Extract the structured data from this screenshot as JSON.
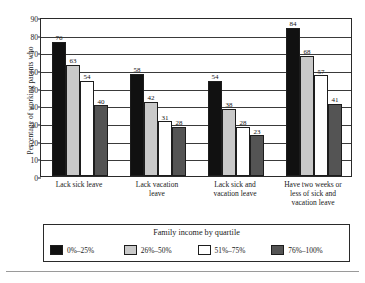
{
  "chart_data": {
    "type": "bar",
    "title": "",
    "xlabel": "",
    "ylabel": "Percentage of working parents who",
    "ylim": [
      0,
      90
    ],
    "ytick_step": 10,
    "yticks": [
      0,
      10,
      20,
      30,
      40,
      50,
      60,
      70,
      80,
      90
    ],
    "grid": true,
    "legend_position": "bottom",
    "legend_title": "Family income by quartile",
    "categories": [
      "Lack sick leave",
      "Lack vacation leave",
      "Lack sick and vacation leave",
      "Have two weeks or less of sick and vacation leave"
    ],
    "category_lines": [
      [
        "Lack sick leave"
      ],
      [
        "Lack vacation",
        "leave"
      ],
      [
        "Lack sick and",
        "vacation leave"
      ],
      [
        "Have two weeks or",
        "less of sick and",
        "vacation leave"
      ]
    ],
    "series": [
      {
        "name": "0%–25%",
        "color": "#111111",
        "values": [
          76,
          58,
          54,
          84
        ]
      },
      {
        "name": "26%–50%",
        "color": "#c9c9c9",
        "values": [
          63,
          42,
          38,
          68
        ]
      },
      {
        "name": "51%–75%",
        "color": "#ffffff",
        "values": [
          54,
          31,
          28,
          57
        ]
      },
      {
        "name": "76%–100%",
        "color": "#545454",
        "values": [
          40,
          28,
          23,
          41
        ]
      }
    ]
  }
}
